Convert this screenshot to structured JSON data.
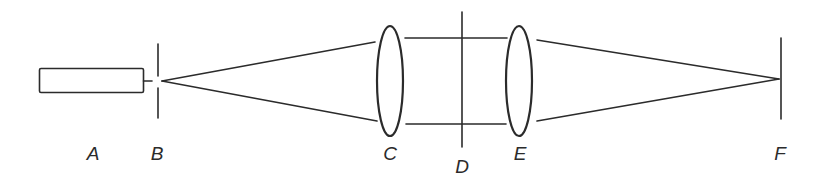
{
  "diagram": {
    "type": "optical-setup",
    "stroke_color": "#2b2b2b",
    "background": "#ffffff",
    "components": [
      {
        "id": "A",
        "label": "A",
        "kind": "light-source"
      },
      {
        "id": "B",
        "label": "B",
        "kind": "pinhole"
      },
      {
        "id": "C",
        "label": "C",
        "kind": "lens"
      },
      {
        "id": "D",
        "label": "D",
        "kind": "plane"
      },
      {
        "id": "E",
        "label": "E",
        "kind": "lens"
      },
      {
        "id": "F",
        "label": "F",
        "kind": "image-plane"
      }
    ],
    "labels": {
      "A": "A",
      "B": "B",
      "C": "C",
      "D": "D",
      "E": "E",
      "F": "F"
    }
  }
}
